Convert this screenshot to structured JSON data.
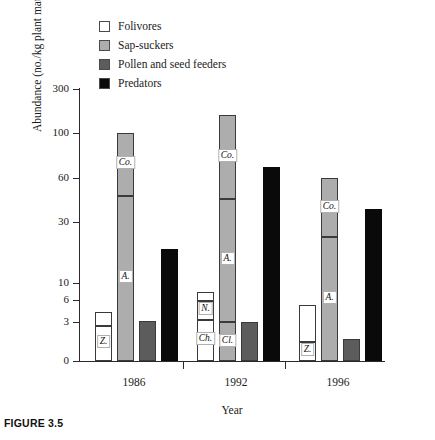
{
  "figure": {
    "caption": "FIGURE 3.5"
  },
  "chart_data": {
    "type": "bar",
    "subtype": "grouped-stacked",
    "title": "",
    "xlabel": "Year",
    "ylabel": "Abundance (no./kg plant material)",
    "categories": [
      "1986",
      "1992",
      "1996"
    ],
    "yticks": [
      0,
      3,
      6,
      10,
      30,
      60,
      100,
      300
    ],
    "ytick_labels": [
      "0",
      "3",
      "6",
      "10",
      "30",
      "60",
      "100",
      "300"
    ],
    "yscale": "log-like",
    "ylim": [
      0,
      300
    ],
    "grid": false,
    "legend_position": "top-left",
    "legend": [
      {
        "label": "Folivores",
        "color": "#ffffff"
      },
      {
        "label": "Sap-suckers",
        "color": "#adadad"
      },
      {
        "label": "Pollen and seed feeders",
        "color": "#5c5c5c"
      },
      {
        "label": "Predators",
        "color": "#0a0a0a"
      }
    ],
    "series": [
      {
        "name": "Folivores",
        "values": [
          4.4,
          8.0,
          5.3
        ]
      },
      {
        "name": "Sap-suckers",
        "values": [
          100,
          180,
          60
        ]
      },
      {
        "name": "Pollen and seed feeders",
        "values": [
          3.1,
          3.0,
          1.7
        ]
      },
      {
        "name": "Predators",
        "values": [
          21,
          70,
          39
        ]
      }
    ],
    "groups": [
      {
        "year": "1986",
        "bars": [
          {
            "guild": "Folivores",
            "total": 4.4,
            "segments": [
              {
                "from": 0,
                "to": 2.7,
                "label": "Z."
              },
              {
                "from": 2.7,
                "to": 4.4,
                "label": ""
              }
            ]
          },
          {
            "guild": "Sap-suckers",
            "total": 100,
            "segments": [
              {
                "from": 0,
                "to": 48,
                "label": "A."
              },
              {
                "from": 48,
                "to": 100,
                "label": "Co."
              }
            ]
          },
          {
            "guild": "Pollen and seed feeders",
            "total": 3.1,
            "segments": [
              {
                "from": 0,
                "to": 3.1,
                "label": ""
              }
            ]
          },
          {
            "guild": "Predators",
            "total": 21,
            "segments": [
              {
                "from": 0,
                "to": 21,
                "label": ""
              }
            ]
          }
        ]
      },
      {
        "year": "1992",
        "bars": [
          {
            "guild": "Folivores",
            "total": 8.0,
            "segments": [
              {
                "from": 0,
                "to": 3.3,
                "label": "Ch."
              },
              {
                "from": 3.3,
                "to": 5.9,
                "label": "N."
              },
              {
                "from": 5.9,
                "to": 8.0,
                "label": ""
              }
            ]
          },
          {
            "guild": "Sap-suckers",
            "total": 180,
            "segments": [
              {
                "from": 0,
                "to": 3.0,
                "label": "Cl."
              },
              {
                "from": 3.0,
                "to": 46,
                "label": "A."
              },
              {
                "from": 46,
                "to": 180,
                "label": "Co."
              }
            ]
          },
          {
            "guild": "Pollen and seed feeders",
            "total": 3.0,
            "segments": [
              {
                "from": 0,
                "to": 3.0,
                "label": ""
              }
            ]
          },
          {
            "guild": "Predators",
            "total": 70,
            "segments": [
              {
                "from": 0,
                "to": 70,
                "label": ""
              }
            ]
          }
        ]
      },
      {
        "year": "1996",
        "bars": [
          {
            "guild": "Folivores",
            "total": 5.3,
            "segments": [
              {
                "from": 0,
                "to": 1.5,
                "label": "Z."
              },
              {
                "from": 1.5,
                "to": 5.3,
                "label": ""
              }
            ]
          },
          {
            "guild": "Sap-suckers",
            "total": 60,
            "segments": [
              {
                "from": 0,
                "to": 25,
                "label": "A."
              },
              {
                "from": 25,
                "to": 60,
                "label": "Co."
              }
            ]
          },
          {
            "guild": "Pollen and seed feeders",
            "total": 1.7,
            "segments": [
              {
                "from": 0,
                "to": 1.7,
                "label": ""
              }
            ]
          },
          {
            "guild": "Predators",
            "total": 39,
            "segments": [
              {
                "from": 0,
                "to": 39,
                "label": ""
              }
            ]
          }
        ]
      }
    ]
  }
}
